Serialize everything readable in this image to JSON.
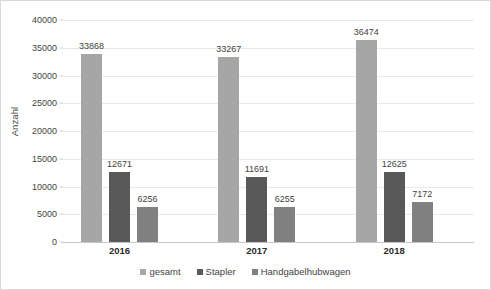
{
  "chart_data": {
    "type": "bar",
    "title": "",
    "subtitle": "",
    "xlabel": "",
    "ylabel": "Anzahl",
    "categories": [
      "2016",
      "2017",
      "2018"
    ],
    "series": [
      {
        "name": "gesamt",
        "color": "#a6a6a6",
        "values": [
          33868,
          33267,
          36474
        ]
      },
      {
        "name": "Stapler",
        "color": "#595959",
        "values": [
          12671,
          11691,
          12625
        ]
      },
      {
        "name": "Handgabelhubwagen",
        "color": "#808080",
        "values": [
          6256,
          6255,
          7172
        ]
      }
    ],
    "ylim": [
      0,
      40000
    ],
    "ytick_step": 5000,
    "ytick_labels": [
      "0",
      "5000",
      "10000",
      "15000",
      "20000",
      "25000",
      "30000",
      "35000",
      "40000"
    ],
    "grid": true,
    "grid_color": "#e8e8e8",
    "axis_color": "#c7c7c7",
    "legend_position": "bottom",
    "data_labels": true,
    "border_color": "#d9d9d9",
    "background": "#ffffff",
    "text_color": "#3f3f3f"
  }
}
